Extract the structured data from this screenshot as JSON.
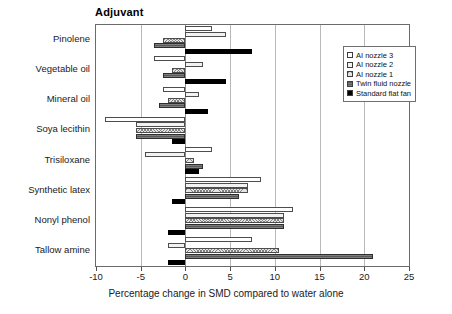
{
  "chart_data": {
    "type": "bar",
    "orientation": "horizontal",
    "title": "Adjuvant",
    "xlabel": "Percentage change in SMD compared to water alone",
    "ylabel": "",
    "xlim": [
      -10,
      25
    ],
    "xticks": [
      -10,
      -5,
      0,
      5,
      10,
      15,
      20,
      25
    ],
    "xtick_labels": [
      "-10",
      "-5",
      "0",
      "5",
      "10",
      "15",
      "20",
      "25"
    ],
    "grid": true,
    "grid_axis": "x",
    "legend_position": "upper right",
    "categories": [
      "Pinolene",
      "Vegetable oil",
      "Mineral oil",
      "Soya lecithin",
      "Trisiloxane",
      "Synthetic latex",
      "Nonyl phenol",
      "Tallow amine"
    ],
    "series": [
      {
        "name": "AI nozzle 3",
        "swatch": "white-open",
        "color": "#ffffff",
        "values": [
          3.0,
          -3.5,
          -2.5,
          -9.0,
          3.0,
          8.5,
          12.0,
          7.5
        ]
      },
      {
        "name": "AI nozzle 2",
        "swatch": "light-dotted",
        "color": "#f2f2f2",
        "values": [
          4.5,
          2.0,
          1.5,
          -5.5,
          -4.5,
          7.0,
          11.0,
          -2.0
        ]
      },
      {
        "name": "AI nozzle 1",
        "swatch": "crosshatch",
        "color": "#e4e4e4",
        "values": [
          -2.5,
          -1.5,
          -2.0,
          -5.5,
          1.0,
          7.0,
          11.0,
          10.5
        ]
      },
      {
        "name": "Twin fluid nozzle",
        "swatch": "dark-gray",
        "color": "#5a5a5a",
        "values": [
          -3.5,
          -2.5,
          -3.0,
          -5.5,
          2.0,
          6.0,
          11.0,
          21.0
        ]
      },
      {
        "name": "Standard flat fan",
        "swatch": "solid-black",
        "color": "#000000",
        "values": [
          7.5,
          4.5,
          2.5,
          -1.5,
          1.5,
          -1.5,
          -2.0,
          -2.0
        ]
      }
    ]
  }
}
